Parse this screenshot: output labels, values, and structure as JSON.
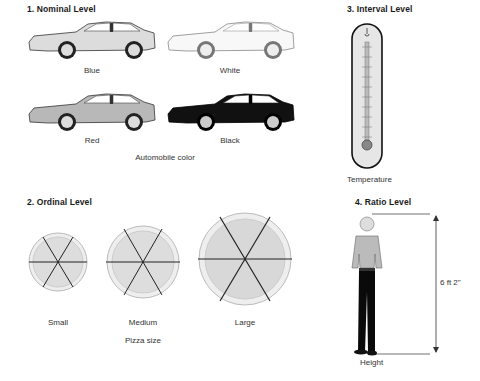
{
  "sections": {
    "nominal": {
      "title": "1. Nominal Level",
      "items": [
        {
          "label": "Blue",
          "fill": "#dcdcdc"
        },
        {
          "label": "White",
          "fill": "#f8f8f8"
        },
        {
          "label": "Red",
          "fill": "#b8b8b8"
        },
        {
          "label": "Black",
          "fill": "#111111"
        }
      ],
      "caption": "Automobile color"
    },
    "ordinal": {
      "title": "2. Ordinal Level",
      "items": [
        {
          "label": "Small"
        },
        {
          "label": "Medium"
        },
        {
          "label": "Large"
        }
      ],
      "caption": "Pizza size"
    },
    "interval": {
      "title": "3. Interval Level",
      "caption": "Temperature"
    },
    "ratio": {
      "title": "4. Ratio Level",
      "measurement": "6 ft 2\"",
      "caption": "Height"
    }
  }
}
